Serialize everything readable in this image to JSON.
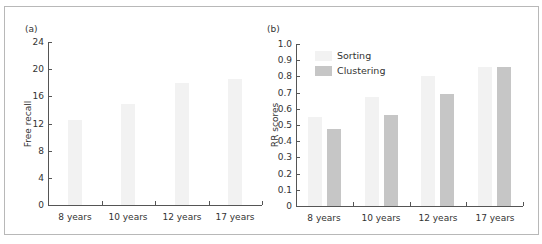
{
  "chart_data": [
    {
      "panel": "(a)",
      "type": "bar",
      "title": "",
      "xlabel": "",
      "ylabel": "Free recall",
      "ylim": [
        0,
        24
      ],
      "yticks": [
        0,
        4,
        8,
        12,
        16,
        20,
        24
      ],
      "grid": false,
      "categories": [
        "8 years",
        "10 years",
        "12 years",
        "17 years"
      ],
      "values": [
        12.5,
        14.8,
        18.0,
        18.5
      ],
      "colors": {
        "bar": "#f2f2f2"
      }
    },
    {
      "panel": "(b)",
      "type": "bar",
      "title": "",
      "xlabel": "",
      "ylabel": "RR scores",
      "ylim": [
        0,
        1.0
      ],
      "yticks": [
        0,
        0.1,
        0.2,
        0.3,
        0.4,
        0.5,
        0.6,
        0.7,
        0.8,
        0.9,
        1.0
      ],
      "grid": false,
      "legend_position": "upper left",
      "categories": [
        "8 years",
        "10 years",
        "12 years",
        "17 years"
      ],
      "series": [
        {
          "name": "Sorting",
          "values": [
            0.55,
            0.67,
            0.8,
            0.86
          ],
          "color": "#f2f2f2"
        },
        {
          "name": "Clustering",
          "values": [
            0.475,
            0.56,
            0.69,
            0.86
          ],
          "color": "#c6c6c6"
        }
      ]
    }
  ],
  "panels": {
    "a": {
      "label": "(a)",
      "ylabel": "Free recall",
      "ytick_labels": [
        "0",
        "4",
        "8",
        "12",
        "16",
        "20",
        "24"
      ],
      "xtick_labels": [
        "8 years",
        "10 years",
        "12 years",
        "17 years"
      ]
    },
    "b": {
      "label": "(b)",
      "ylabel": "RR scores",
      "ytick_labels": [
        "0",
        "0.1",
        "0.2",
        "0.3",
        "0.4",
        "0.5",
        "0.6",
        "0.7",
        "0.8",
        "0.9",
        "1.0"
      ],
      "xtick_labels": [
        "8 years",
        "10 years",
        "12 years",
        "17 years"
      ],
      "legend": [
        "Sorting",
        "Clustering"
      ]
    }
  }
}
